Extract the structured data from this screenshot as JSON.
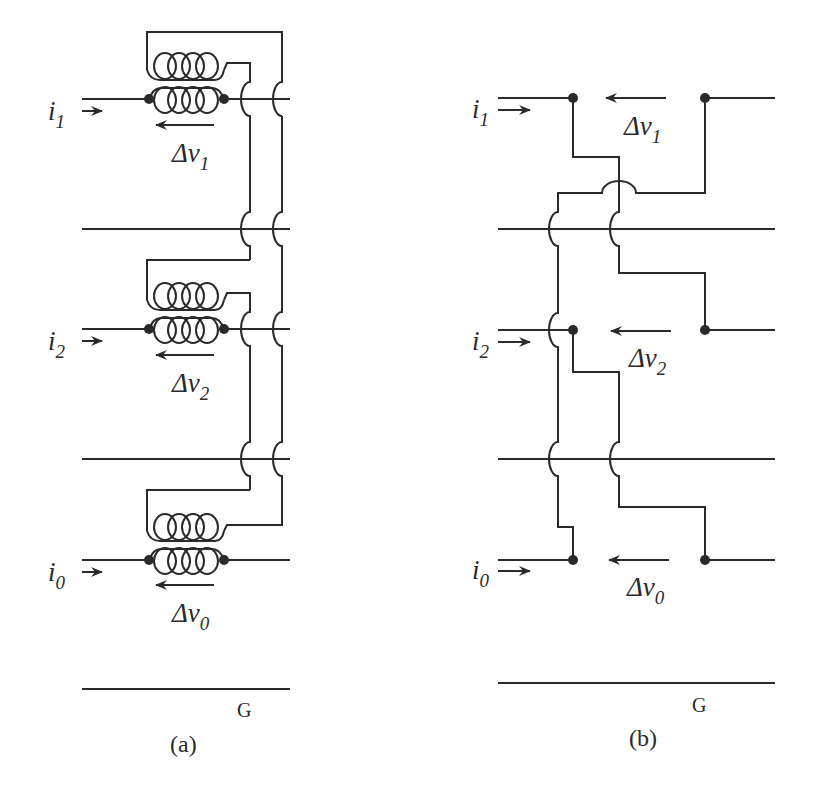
{
  "figure": {
    "panels": [
      {
        "id": "a",
        "caption": "(a)",
        "ground_label": "G",
        "phases": [
          {
            "current": "i",
            "current_sub": "1",
            "dv": "Δv",
            "dv_sub": "1"
          },
          {
            "current": "i",
            "current_sub": "2",
            "dv": "Δv",
            "dv_sub": "2"
          },
          {
            "current": "i",
            "current_sub": "0",
            "dv": "Δv",
            "dv_sub": "0"
          }
        ]
      },
      {
        "id": "b",
        "caption": "(b)",
        "ground_label": "G",
        "phases": [
          {
            "current": "i",
            "current_sub": "1",
            "dv": "Δv",
            "dv_sub": "1"
          },
          {
            "current": "i",
            "current_sub": "2",
            "dv": "Δv",
            "dv_sub": "2"
          },
          {
            "current": "i",
            "current_sub": "0",
            "dv": "Δv",
            "dv_sub": "0"
          }
        ]
      }
    ],
    "colors": {
      "ink": "#2a2a2a",
      "background": "#ffffff"
    }
  }
}
